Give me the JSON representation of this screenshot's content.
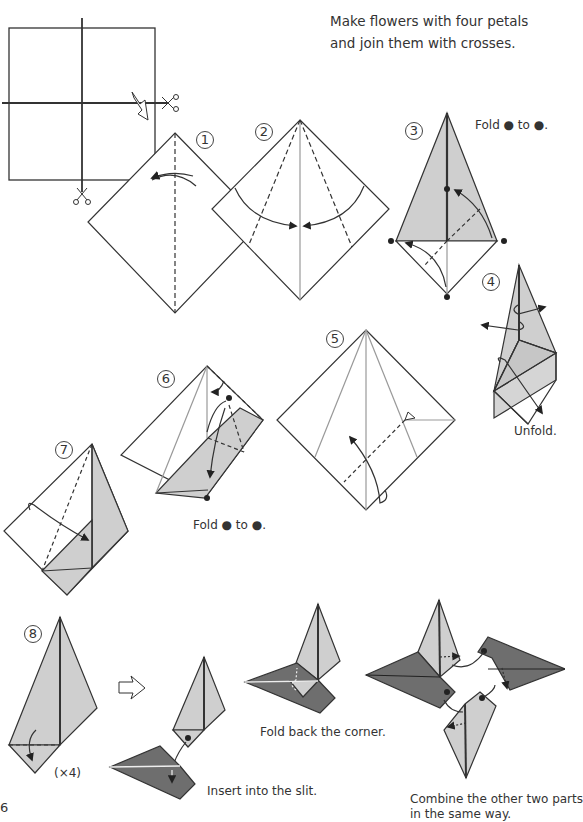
{
  "title": {
    "line1": "Make flowers with four petals",
    "line2": "and join them with crosses."
  },
  "colors": {
    "light_gray": "#cfcfcf",
    "dark_gray": "#6e6e6e",
    "line": "#333333",
    "background": "#ffffff"
  },
  "steps": [
    {
      "number": "1",
      "symbol": "①",
      "caption": ""
    },
    {
      "number": "2",
      "symbol": "②",
      "caption": ""
    },
    {
      "number": "3",
      "symbol": "③",
      "caption": "Fold ● to ●."
    },
    {
      "number": "4",
      "symbol": "④",
      "caption": "Unfold."
    },
    {
      "number": "5",
      "symbol": "⑤",
      "caption": ""
    },
    {
      "number": "6",
      "symbol": "⑥",
      "caption": "Fold ● to ●."
    },
    {
      "number": "7",
      "symbol": "⑦",
      "caption": ""
    },
    {
      "number": "8",
      "symbol": "⑧",
      "caption": "(×4)"
    }
  ],
  "assembly": {
    "insert_caption": "Insert into the slit.",
    "fold_back_caption": "Fold back the corner.",
    "combine_caption_line1": "Combine the other two parts",
    "combine_caption_line2": "in the same way."
  },
  "icons": {
    "scissors": "scissors-icon",
    "cut_arrow": "hollow-arrow-icon",
    "next_arrow": "hollow-arrow-right-icon"
  },
  "page_number": "6"
}
